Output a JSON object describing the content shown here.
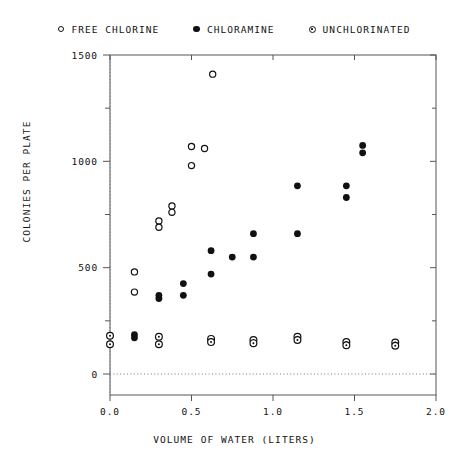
{
  "chart_data": {
    "type": "scatter",
    "title": "",
    "xlabel": "VOLUME OF WATER (LITERS)",
    "ylabel": "COLONIES PER PLATE",
    "xlim": [
      0.0,
      2.0
    ],
    "ylim": [
      0,
      1500
    ],
    "xticks": [
      0.0,
      0.5,
      1.0,
      1.5,
      2.0
    ],
    "xticklabels": [
      "0.0",
      "0.5",
      "1.0",
      "1.5",
      "2.0"
    ],
    "yticks": [
      0,
      500,
      1000,
      1500
    ],
    "yticklabels": [
      "0",
      "500",
      "1000",
      "1500"
    ],
    "y_minor_ticks": [
      250,
      750,
      1250
    ],
    "grid": false,
    "reference_lines": [
      {
        "axis": "x",
        "value": 0.0,
        "style": "dotted"
      },
      {
        "axis": "y",
        "value": 0,
        "style": "dotted"
      }
    ],
    "legend_position": "top-center",
    "series": [
      {
        "name": "FREE CHLORINE",
        "marker": "open-circle",
        "color": "#111111",
        "points": [
          [
            0.63,
            1410
          ],
          [
            0.5,
            1070
          ],
          [
            0.58,
            1060
          ],
          [
            0.5,
            980
          ],
          [
            0.38,
            790
          ],
          [
            0.38,
            760
          ],
          [
            0.3,
            720
          ],
          [
            0.3,
            690
          ],
          [
            0.15,
            480
          ],
          [
            0.15,
            385
          ]
        ]
      },
      {
        "name": "CHLORAMINE",
        "marker": "filled-circle",
        "color": "#111111",
        "points": [
          [
            1.55,
            1075
          ],
          [
            1.55,
            1040
          ],
          [
            1.15,
            885
          ],
          [
            1.45,
            885
          ],
          [
            1.45,
            830
          ],
          [
            0.88,
            660
          ],
          [
            1.15,
            660
          ],
          [
            0.62,
            580
          ],
          [
            0.75,
            550
          ],
          [
            0.88,
            550
          ],
          [
            0.62,
            470
          ],
          [
            0.45,
            425
          ],
          [
            0.3,
            370
          ],
          [
            0.3,
            355
          ],
          [
            0.45,
            370
          ],
          [
            0.15,
            185
          ],
          [
            0.15,
            170
          ]
        ]
      },
      {
        "name": "UNCHLORINATED",
        "marker": "dotted-circle",
        "color": "#111111",
        "points": [
          [
            0.0,
            180
          ],
          [
            0.0,
            140
          ],
          [
            0.3,
            175
          ],
          [
            0.3,
            140
          ],
          [
            0.62,
            165
          ],
          [
            0.62,
            150
          ],
          [
            0.88,
            160
          ],
          [
            0.88,
            145
          ],
          [
            1.15,
            175
          ],
          [
            1.15,
            160
          ],
          [
            1.45,
            150
          ],
          [
            1.45,
            135
          ],
          [
            1.75,
            148
          ],
          [
            1.75,
            133
          ]
        ]
      }
    ]
  },
  "legend": {
    "entries": [
      {
        "label": "FREE CHLORINE",
        "marker": "open"
      },
      {
        "label": "CHLORAMINE",
        "marker": "filled"
      },
      {
        "label": "UNCHLORINATED",
        "marker": "dotted"
      }
    ]
  },
  "axes": {
    "x_title": "VOLUME OF WATER (LITERS)",
    "y_title": "COLONIES PER PLATE"
  }
}
